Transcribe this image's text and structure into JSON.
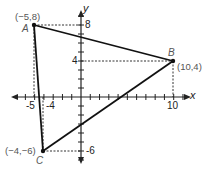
{
  "figure": {
    "type": "coordinate-plane-triangle",
    "axes": {
      "x_label": "x",
      "y_label": "y",
      "x_ticks_labeled": [
        "-5",
        "-4",
        "10"
      ],
      "y_ticks_labeled": [
        "8",
        "4",
        "-6"
      ],
      "x_range": [
        -6,
        11
      ],
      "y_range": [
        -7,
        9
      ]
    },
    "points": [
      {
        "name": "A",
        "coord_label": "(−5,8)",
        "x": -5,
        "y": 8
      },
      {
        "name": "B",
        "coord_label": "(10,4)",
        "x": 10,
        "y": 4
      },
      {
        "name": "C",
        "coord_label": "(−4,−6)",
        "x": -4,
        "y": -6
      }
    ],
    "colors": {
      "line": "#111111",
      "guide": "#333333",
      "label": "#555555"
    }
  }
}
